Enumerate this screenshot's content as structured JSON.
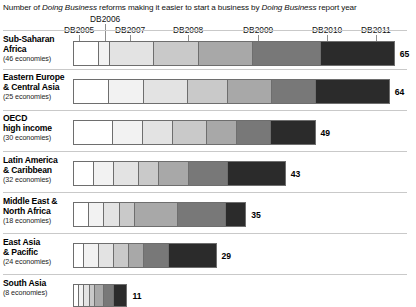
{
  "title": {
    "pre": "Number of ",
    "em1": "Doing Business",
    "mid": " reforms making it easier to start a business by ",
    "em2": "Doing Business",
    "post": " report year"
  },
  "chart_data": {
    "type": "bar",
    "subtype": "stacked-horizontal",
    "title": "Number of Doing Business reforms making it easier to start a business by Doing Business report year",
    "xlabel": "",
    "ylabel": "",
    "grid": false,
    "legend_position": "top-axis",
    "xlim": [
      0,
      65
    ],
    "series": [
      {
        "name": "DB2005",
        "color": "#ffffff"
      },
      {
        "name": "DB2006",
        "color": "#f2f2f2"
      },
      {
        "name": "DB2007",
        "color": "#e3e3e3"
      },
      {
        "name": "DB2008",
        "color": "#c9c9c9"
      },
      {
        "name": "DB2009",
        "color": "#a8a8a8"
      },
      {
        "name": "DB2010",
        "color": "#787878"
      },
      {
        "name": "DB2011",
        "color": "#2b2b2b"
      }
    ],
    "axis_ticks": [
      {
        "label": "DB2005",
        "x": 79
      },
      {
        "label": "DB2006",
        "x": 105
      },
      {
        "label": "DB2007",
        "x": 130
      },
      {
        "label": "DB2008",
        "x": 188
      },
      {
        "label": "DB2009",
        "x": 258
      },
      {
        "label": "DB2010",
        "x": 327
      },
      {
        "label": "DB2011",
        "x": 376
      }
    ],
    "categories": [
      {
        "name": "Sub-Saharan Africa",
        "line1": "Sub-Saharan",
        "line2": "Africa",
        "economies": "(46 economies)",
        "total": 65,
        "values": [
          5,
          2,
          9,
          9,
          11,
          14,
          15
        ]
      },
      {
        "name": "Eastern Europe & Central Asia",
        "line1": "Eastern Europe",
        "line2": "& Central Asia",
        "economies": "(25 economies)",
        "total": 64,
        "values": [
          7,
          7,
          9,
          8,
          9,
          9,
          15
        ]
      },
      {
        "name": "OECD high income",
        "line1": "OECD",
        "line2": "high income",
        "economies": "(30 economies)",
        "total": 49,
        "values": [
          8,
          6,
          6,
          7,
          6,
          7,
          9
        ]
      },
      {
        "name": "Latin America & Caribbean",
        "line1": "Latin America",
        "line2": "& Caribbean",
        "economies": "(32 economies)",
        "total": 43,
        "values": [
          4,
          4,
          5,
          4,
          6,
          8,
          12
        ]
      },
      {
        "name": "Middle East & North Africa",
        "line1": "Middle East &",
        "line2": "North Africa",
        "economies": "(18 economies)",
        "total": 35,
        "values": [
          3,
          3,
          3,
          3,
          9,
          10,
          4
        ]
      },
      {
        "name": "East Asia & Pacific",
        "line1": "East Asia",
        "line2": "& Pacific",
        "economies": "(24 economies)",
        "total": 29,
        "values": [
          2,
          3,
          3,
          3,
          3,
          5,
          10
        ]
      },
      {
        "name": "South Asia",
        "line1": "South Asia",
        "line2": "",
        "economies": "(8 economies)",
        "total": 11,
        "values": [
          1,
          1,
          1,
          1,
          2,
          2,
          3
        ]
      }
    ]
  },
  "layout": {
    "bar_x": 73,
    "unit_px": 4.95,
    "rows": [
      {
        "top": 41,
        "height": 25,
        "label_top": 34,
        "sep_top": 30
      },
      {
        "top": 79,
        "height": 25,
        "label_top": 72,
        "sep_top": 69
      },
      {
        "top": 120,
        "height": 25,
        "label_top": 113,
        "sep_top": 110
      },
      {
        "top": 161,
        "height": 25,
        "label_top": 155,
        "sep_top": 151
      },
      {
        "top": 202,
        "height": 25,
        "label_top": 196,
        "sep_top": 192
      },
      {
        "top": 243,
        "height": 25,
        "label_top": 237,
        "sep_top": 233
      },
      {
        "top": 284,
        "height": 23,
        "label_top": 278,
        "sep_top": 274
      }
    ]
  }
}
